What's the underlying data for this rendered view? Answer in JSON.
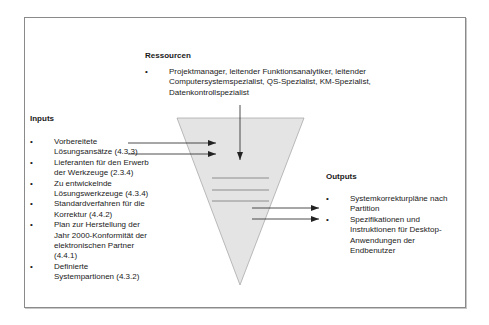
{
  "resources": {
    "heading": "Ressourcen",
    "items": [
      {
        "bullet": "•",
        "lines": [
          "Projektmanager, leitender Funktionsanalytiker, leitender",
          "Computersystemspezialist, QS-Spezialist, KM-Spezialist,",
          "Datenkontrollspezialist"
        ]
      }
    ]
  },
  "inputs": {
    "heading": "Inputs",
    "items": [
      {
        "bullet": "•",
        "lines": [
          "Vorbereitete",
          "Lösungsansätze (4.3.3)"
        ]
      },
      {
        "bullet": "•",
        "lines": [
          "Lieferanten für den Erwerb",
          "der Werkzeuge (2.3.4)"
        ]
      },
      {
        "bullet": "•",
        "lines": [
          "Zu entwickelnde",
          "Lösungswerkzeuge (4.3.4)"
        ]
      },
      {
        "bullet": "•",
        "lines": [
          "Standardverfahren für die",
          "Korrektur (4.4.2)"
        ]
      },
      {
        "bullet": "•",
        "lines": [
          "Plan zur Herstellung der",
          "Jahr 2000-Konformität der",
          "elektronischen Partner",
          "(4.4.1)"
        ]
      },
      {
        "bullet": "•",
        "lines": [
          "Definierte",
          "Systempartionen (4.3.2)"
        ]
      }
    ]
  },
  "outputs": {
    "heading": "Outputs",
    "items": [
      {
        "bullet": "•",
        "lines": [
          "Systemkorrekturpläne nach",
          "Partition"
        ]
      },
      {
        "bullet": "•",
        "lines": [
          "Spezifikationen und",
          "Instruktionen für Desktop-",
          "Anwendungen der",
          "Endbenutzer"
        ]
      }
    ]
  },
  "colors": {
    "funnel_fill": "#e4e4e4",
    "funnel_stroke": "#9a9a9a",
    "arrow": "#222222",
    "frame": "#8a8a8a"
  }
}
